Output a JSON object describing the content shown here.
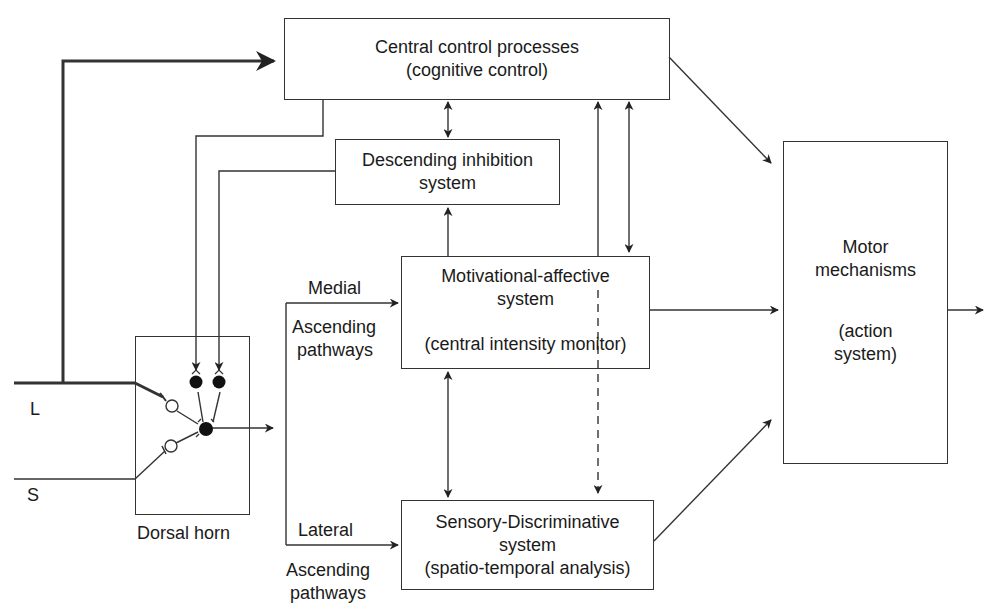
{
  "diagram": {
    "type": "block-flow"
  },
  "boxes": {
    "central": {
      "line1": "Central control processes",
      "line2": "(cognitive control)"
    },
    "descending": {
      "line1": "Descending inhibition",
      "line2": "system"
    },
    "motivational": {
      "line1": "Motivational-affective",
      "line2": "system",
      "line3": "(central intensity monitor)"
    },
    "sensory": {
      "line1": "Sensory-Discriminative",
      "line2": "system",
      "line3": "(spatio-temporal analysis)"
    },
    "motor": {
      "line1": "Motor",
      "line2": "mechanisms",
      "line3": "(action",
      "line4": "system)"
    },
    "dorsal": {
      "caption": "Dorsal horn"
    }
  },
  "labels": {
    "input_large": "L",
    "input_small": "S",
    "medial": "Medial",
    "medial_ascending": "Ascending",
    "medial_pathways": "pathways",
    "lateral": "Lateral",
    "lateral_ascending": "Ascending",
    "lateral_pathways": "pathways"
  },
  "connections": [
    {
      "from": "L fiber",
      "to": "Central control processes",
      "style": "thick arrow"
    },
    {
      "from": "Central control processes",
      "to": "Descending inhibition system",
      "style": "bidirectional"
    },
    {
      "from": "Central control processes",
      "to": "Dorsal horn",
      "style": "arrow"
    },
    {
      "from": "Descending inhibition system",
      "to": "Dorsal horn",
      "style": "arrow"
    },
    {
      "from": "Motivational-affective system",
      "to": "Descending inhibition system",
      "style": "arrow"
    },
    {
      "from": "Motivational-affective system",
      "to": "Central control processes",
      "style": "arrow"
    },
    {
      "from": "Central control processes",
      "to": "Motivational-affective system",
      "style": "bidirectional"
    },
    {
      "from": "Central control processes",
      "to": "Motor mechanisms",
      "style": "arrow"
    },
    {
      "from": "Motivational-affective system",
      "to": "Motor mechanisms",
      "style": "arrow"
    },
    {
      "from": "Sensory-Discriminative system",
      "to": "Motor mechanisms",
      "style": "arrow"
    },
    {
      "from": "Motivational-affective system",
      "to": "Sensory-Discriminative system",
      "style": "bidirectional"
    },
    {
      "from": "Central control processes",
      "to": "Sensory-Discriminative system",
      "style": "dashed arrow"
    },
    {
      "from": "Dorsal horn",
      "to": "Medial ascending pathways",
      "style": "arrow"
    },
    {
      "from": "Dorsal horn",
      "to": "Lateral ascending pathways",
      "style": "arrow"
    },
    {
      "from": "Motor mechanisms",
      "to": "output",
      "style": "arrow"
    }
  ],
  "colors": {
    "line": "#333333",
    "text": "#1a1a1a",
    "background": "#ffffff"
  }
}
